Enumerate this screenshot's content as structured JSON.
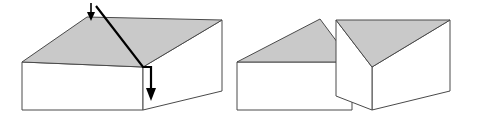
{
  "figure": {
    "background_color": "#ffffff",
    "edge_color": "#4a4a4a",
    "cut_line_color": "#000000",
    "shaded_face_color": "#c9c9c9",
    "unshaded_face_color": "#ffffff",
    "panels": [
      {
        "id": "before-cut",
        "label": "Uncut rectangular prism with diagonal cut plane indicated",
        "shapes": [
          {
            "name": "top-face",
            "fill": "#c9c9c9",
            "points": "22,62 87,17 222,20 143,67"
          },
          {
            "name": "front-face",
            "fill": "#ffffff",
            "points": "22,62 143,67 143,110 22,110"
          },
          {
            "name": "right-side-face",
            "fill": "#ffffff",
            "points": "143,67 222,20 222,91 143,110"
          }
        ],
        "cut": {
          "name": "diagonal-cut-line",
          "points": "96,6 143,67 151,67 151,92",
          "upper_arrow": {
            "name": "upper-cut-arrow",
            "shaft_x1": 91,
            "shaft_y1": 5,
            "shaft_x2": 91,
            "shaft_y2": 17,
            "head_points": "91,21 87,12 95,12",
            "tail_head_points": "91,2 87,10 95,10"
          },
          "lower_arrow": {
            "name": "lower-cut-arrow",
            "shaft_x1": 151,
            "shaft_y1": 67,
            "shaft_x2": 151,
            "shaft_y2": 92,
            "head_points": "151,101 146,88 156,88"
          }
        }
      },
      {
        "id": "after-cut",
        "label": "Two separated triangular prism halves",
        "left_half": {
          "name": "left-triangular-prism",
          "shapes": [
            {
              "name": "top-face",
              "fill": "#c9c9c9",
              "points": "237,62 320,19 352,62"
            },
            {
              "name": "front-face",
              "fill": "#ffffff",
              "points": "237,62 352,62 352,110 237,110"
            }
          ]
        },
        "right_half": {
          "name": "right-triangular-prism",
          "shapes": [
            {
              "name": "top-face",
              "fill": "#c9c9c9",
              "points": "336,20 450,20 372,67"
            },
            {
              "name": "front-face",
              "fill": "#ffffff",
              "points": "336,20 372,67 372,110 336,96"
            },
            {
              "name": "side-face",
              "fill": "#ffffff",
              "points": "372,67 450,20 450,91 372,110"
            }
          ]
        }
      }
    ]
  }
}
